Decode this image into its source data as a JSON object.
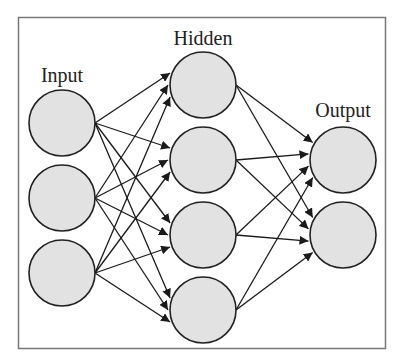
{
  "diagram": {
    "type": "neural-network",
    "layers": [
      {
        "name": "Input",
        "label": "Input",
        "nodes": 3
      },
      {
        "name": "Hidden",
        "label": "Hidden",
        "nodes": 4
      },
      {
        "name": "Output",
        "label": "Output",
        "nodes": 2
      }
    ],
    "connectivity": "fully-connected",
    "colors": {
      "node_fill": "#e2e2e2",
      "node_stroke": "#222222",
      "edge": "#1a1a1a",
      "frame": "#777777"
    }
  },
  "labels": {
    "input": "Input",
    "hidden": "Hidden",
    "output": "Output"
  }
}
